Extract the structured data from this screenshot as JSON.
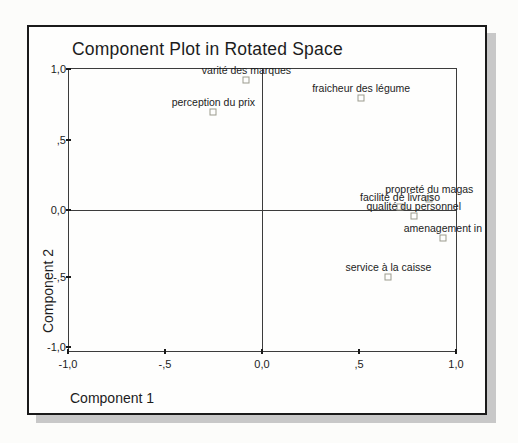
{
  "window_title": "Component Plot in Rotated Space",
  "colors": {
    "page_bg": "#fcfcfa",
    "window_bg": "#fefefd",
    "frame_border": "#1a1a1a",
    "axis_line": "#3c3c3c",
    "text": "#1c1c1c",
    "marker_outline": "#9b9b8e",
    "shadow": "#c8c8c8"
  },
  "chart_data": {
    "type": "scatter",
    "title": "Component Plot in Rotated Space",
    "xlabel": "Component 1",
    "ylabel": "Component 2",
    "xlim": [
      -1.0,
      1.0
    ],
    "ylim": [
      -1.0,
      1.0
    ],
    "grid": false,
    "reference_lines": {
      "x": 0.0,
      "y": 0.0
    },
    "marker_style": "open-square",
    "x_tick_labels": [
      "-1,0",
      "-,5",
      "0,0",
      ",5",
      "1,0"
    ],
    "x_tick_values": [
      -1.0,
      -0.5,
      0.0,
      0.5,
      1.0
    ],
    "y_tick_labels": [
      "1,0",
      ",5",
      "0,0",
      "-,5",
      "-1,0"
    ],
    "y_tick_values": [
      1.0,
      0.5,
      0.0,
      -0.5,
      -1.0
    ],
    "points": [
      {
        "label": "varité des marques",
        "x": -0.08,
        "y": 0.92
      },
      {
        "label": "fraicheur des légume",
        "x": 0.51,
        "y": 0.79
      },
      {
        "label": "perception du prix",
        "x": -0.25,
        "y": 0.69
      },
      {
        "label": "propreté du magas",
        "x": 0.86,
        "y": 0.08
      },
      {
        "label": "facilité de livraiso",
        "x": 0.71,
        "y": 0.02
      },
      {
        "label": "qualité du personnel",
        "x": 0.78,
        "y": -0.04
      },
      {
        "label": "amenagement in",
        "x": 0.93,
        "y": -0.2
      },
      {
        "label": "service à la caisse",
        "x": 0.65,
        "y": -0.47
      }
    ]
  }
}
